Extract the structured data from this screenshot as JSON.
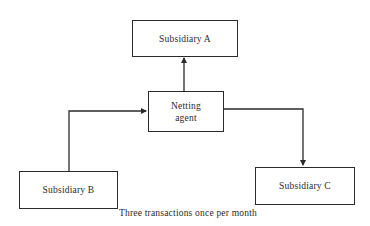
{
  "diagram": {
    "type": "flowchart",
    "nodes": {
      "subsidiary_a": {
        "label": "Subsidiary A"
      },
      "netting_agent": {
        "line1": "Netting",
        "line2": "agent"
      },
      "subsidiary_b": {
        "label": "Subsidiary B"
      },
      "subsidiary_c": {
        "label": "Subsidiary C"
      }
    },
    "edges": [
      {
        "from": "Subsidiary B",
        "to": "Netting agent"
      },
      {
        "from": "Netting agent",
        "to": "Subsidiary A"
      },
      {
        "from": "Netting agent",
        "to": "Subsidiary C"
      }
    ],
    "caption": "Three transactions once per month",
    "colors": {
      "stroke": "#2a2a2a",
      "background": "#ffffff"
    }
  }
}
